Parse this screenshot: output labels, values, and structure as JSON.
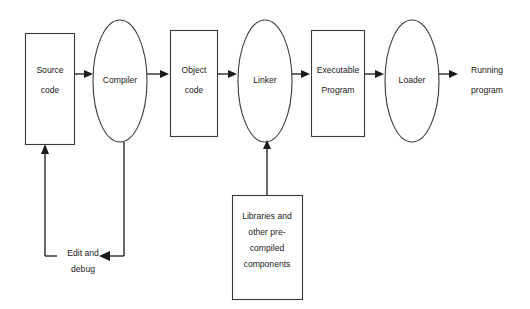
{
  "diagram": {
    "background_color": "#ffffff",
    "stroke_color": "#3a3a3a",
    "arrow_color": "#1a1a1a",
    "text_color": "#1a1a1a",
    "nodes": {
      "source_code": {
        "label_line1": "Source",
        "label_line2": "code",
        "shape": "rectangle"
      },
      "compiler": {
        "label_line1": "Compiler",
        "shape": "ellipse"
      },
      "object_code": {
        "label_line1": "Object",
        "label_line2": "code",
        "shape": "rectangle"
      },
      "linker": {
        "label_line1": "Linker",
        "shape": "ellipse"
      },
      "executable_program": {
        "label_line1": "Executable",
        "label_line2": "Program",
        "shape": "rectangle"
      },
      "loader": {
        "label_line1": "Loader",
        "shape": "ellipse"
      },
      "running_program": {
        "label_line1": "Running",
        "label_line2": "program",
        "shape": "text"
      },
      "libraries": {
        "label_line1": "Libraries and",
        "label_line2": "other pre-",
        "label_line3": "compiled",
        "label_line4": "components",
        "shape": "rectangle"
      }
    },
    "edges": {
      "feedback_loop": {
        "label_line1": "Edit and",
        "label_line2": "debug"
      }
    }
  }
}
